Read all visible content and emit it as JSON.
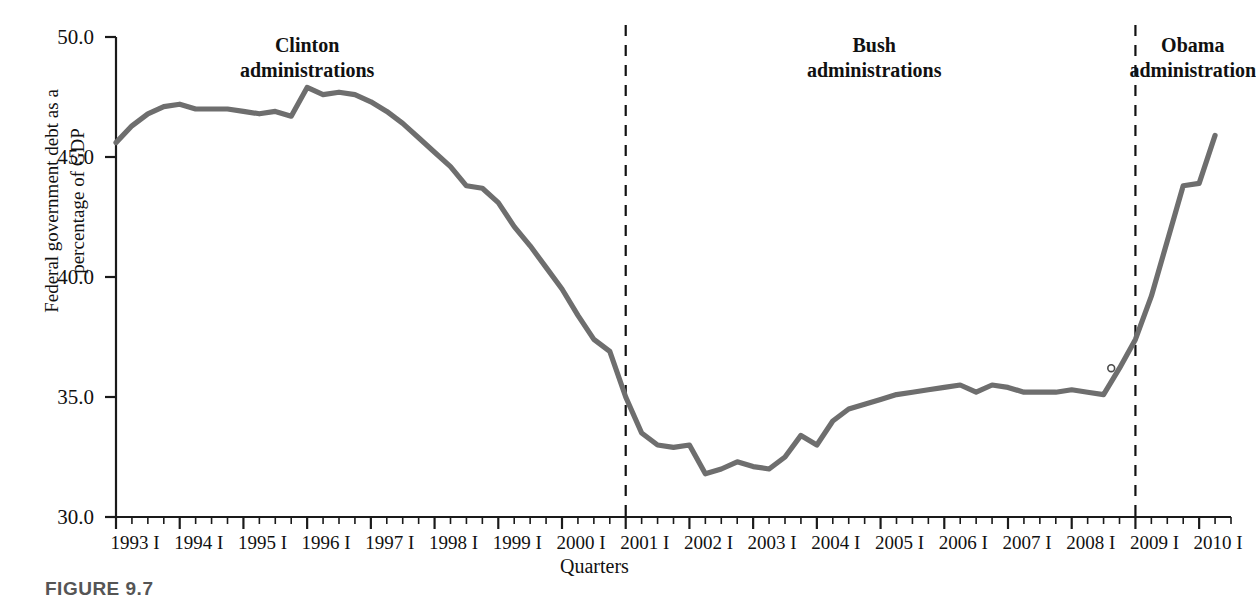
{
  "figure": {
    "caption": "FIGURE 9.7",
    "xaxis_title": "Quarters",
    "yaxis_title": "Federal government debt as a\npercentage of GDP"
  },
  "annotations": [
    {
      "name": "clinton",
      "text": "Clinton\nadministrations",
      "x_value": 1996.0,
      "y_px": 33
    },
    {
      "name": "bush",
      "text": "Bush\nadministrations",
      "x_value": 2004.9,
      "y_px": 33
    },
    {
      "name": "obama",
      "text": "Obama\nadministration",
      "x_value": 2009.9,
      "y_px": 33
    }
  ],
  "dividers": [
    {
      "name": "clinton-bush-divider",
      "x_value": 2001.0
    },
    {
      "name": "bush-obama-divider",
      "x_value": 2009.0
    }
  ],
  "colors": {
    "line": "#6e6e6e",
    "axis": "#1a1a1a",
    "text": "#111111",
    "caption": "#555555"
  },
  "chart_data": {
    "type": "line",
    "title": "",
    "xlabel": "Quarters",
    "ylabel": "Federal government debt as a percentage of GDP",
    "ylim": [
      30.0,
      50.0
    ],
    "xlim": [
      1993.0,
      2010.5
    ],
    "yticks": [
      "30.0",
      "35.0",
      "40.0",
      "45.0",
      "50.0"
    ],
    "ytick_values": [
      30.0,
      35.0,
      40.0,
      45.0,
      50.0
    ],
    "xticks": [
      "1993 I",
      "1994 I",
      "1995 I",
      "1996 I",
      "1997 I",
      "1998 I",
      "1999 I",
      "2000 I",
      "2001 I",
      "2002 I",
      "2003 I",
      "2004 I",
      "2005 I",
      "2006 I",
      "2007 I",
      "2008 I",
      "2009 I",
      "2010 I"
    ],
    "xtick_values": [
      1993,
      1994,
      1995,
      1996,
      1997,
      1998,
      1999,
      2000,
      2001,
      2002,
      2003,
      2004,
      2005,
      2006,
      2007,
      2008,
      2009,
      2010
    ],
    "minor_ticks_per_year": 4,
    "grid": false,
    "legend": false,
    "series": [
      {
        "name": "Federal government debt as a percentage of GDP",
        "color": "#6e6e6e",
        "x": [
          1993.0,
          1993.25,
          1993.5,
          1993.75,
          1994.0,
          1994.25,
          1994.5,
          1994.75,
          1995.0,
          1995.25,
          1995.5,
          1995.75,
          1996.0,
          1996.25,
          1996.5,
          1996.75,
          1997.0,
          1997.25,
          1997.5,
          1997.75,
          1998.0,
          1998.25,
          1998.5,
          1998.75,
          1999.0,
          1999.25,
          1999.5,
          1999.75,
          2000.0,
          2000.25,
          2000.5,
          2000.75,
          2001.0,
          2001.25,
          2001.5,
          2001.75,
          2002.0,
          2002.25,
          2002.5,
          2002.75,
          2003.0,
          2003.25,
          2003.5,
          2003.75,
          2004.0,
          2004.25,
          2004.5,
          2004.75,
          2005.0,
          2005.25,
          2005.5,
          2005.75,
          2006.0,
          2006.25,
          2006.5,
          2006.75,
          2007.0,
          2007.25,
          2007.5,
          2007.75,
          2008.0,
          2008.25,
          2008.5,
          2008.75,
          2009.0,
          2009.25,
          2009.5,
          2009.75,
          2010.0
        ],
        "values": [
          45.6,
          46.3,
          46.8,
          47.1,
          47.2,
          47.0,
          47.0,
          47.0,
          46.9,
          46.8,
          46.9,
          46.7,
          47.9,
          47.6,
          47.7,
          47.6,
          47.3,
          46.9,
          46.4,
          45.8,
          45.2,
          44.6,
          43.8,
          43.7,
          43.1,
          42.1,
          41.3,
          40.4,
          39.5,
          38.4,
          37.4,
          36.9,
          35.0,
          33.5,
          33.0,
          32.9,
          33.0,
          31.8,
          32.0,
          32.3,
          32.1,
          32.0,
          32.5,
          33.4,
          33.0,
          34.0,
          34.5,
          34.7,
          34.9,
          35.1,
          35.2,
          35.3,
          35.4,
          35.5,
          35.2,
          35.5,
          35.4,
          35.2,
          35.2,
          35.2,
          35.3,
          35.2,
          35.1,
          36.2,
          37.4,
          39.2,
          41.5,
          43.8,
          43.9
        ]
      }
    ],
    "marker_points": [
      {
        "name": "2008-q4-marker",
        "x_value": 2008.62,
        "y_value": 36.2
      }
    ],
    "extra_tail": {
      "x_value": 2010.25,
      "y_value": 45.9
    }
  }
}
